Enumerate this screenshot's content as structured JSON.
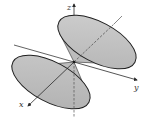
{
  "figure": {
    "axes": {
      "x_label": "x",
      "y_label": "y",
      "z_label": "z"
    },
    "colors": {
      "surface": "#bdbdbd",
      "surface_light": "#d6d6d6",
      "outline": "#2a2a2a",
      "axis": "#3a3a3a",
      "background": "#ffffff"
    }
  }
}
